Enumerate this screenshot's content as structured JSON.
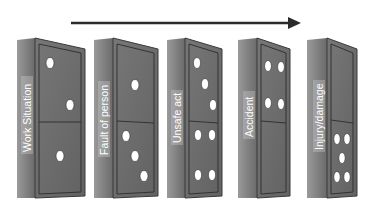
{
  "diagram": {
    "type": "domino-chain",
    "arrow": {
      "direction": "right",
      "x1": 71,
      "x2": 300,
      "y": 23,
      "color": "#2b2b2b"
    },
    "colors": {
      "face": "#6e6e6e",
      "face_border": "#3a3a3a",
      "spine": "#8a8a8a",
      "spine_dark": "#5e5e5e",
      "top_edge": "#9a9a9a",
      "pip": "#ffffff",
      "label_bg": "#d8d8d8",
      "label_text": "#ffffff"
    },
    "dominoes": [
      {
        "label": "Work Situation",
        "top_pips": 2,
        "bottom_pips": 1
      },
      {
        "label": "Fault of person",
        "top_pips": 1,
        "bottom_pips": 3
      },
      {
        "label": "Unsafe act",
        "top_pips": 3,
        "bottom_pips": 4
      },
      {
        "label": "Accident",
        "top_pips": 4,
        "bottom_pips": 0
      },
      {
        "label": "Injury/damage",
        "top_pips": 0,
        "bottom_pips": 5
      }
    ]
  }
}
